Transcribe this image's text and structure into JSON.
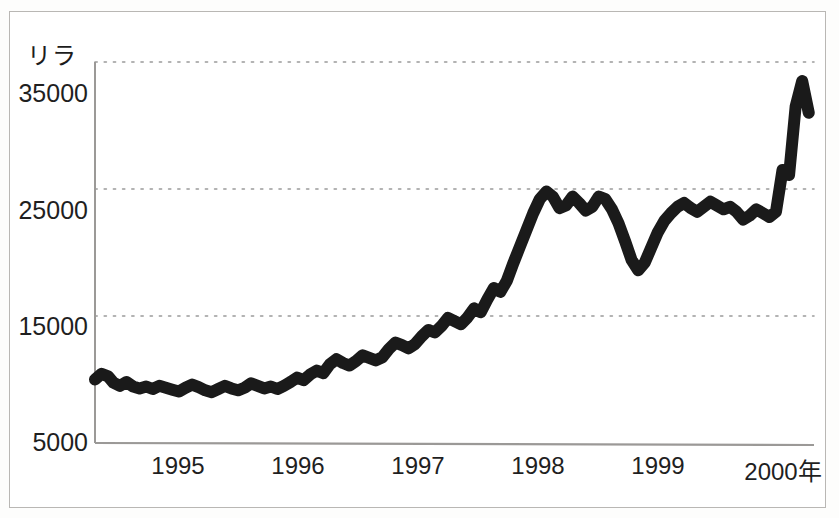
{
  "figure": {
    "background_color": "#ffffff",
    "frame_color": "#b9b7b4",
    "line_color": "#1a1a1a",
    "grid_color": "#9a9a9a",
    "axis_color": "#9b9997"
  },
  "axes": {
    "y_title": "リラ",
    "x_unit_suffix": "年"
  },
  "chart_data": {
    "type": "line",
    "title": "",
    "subtitle": "",
    "xlabel": "年",
    "ylabel": "リラ",
    "grid": true,
    "legend": false,
    "legend_position": "none",
    "xlim": [
      1994.52,
      2000.0
    ],
    "ylim": [
      5000,
      35000
    ],
    "ytick_labels": [
      "5000",
      "15000",
      "25000",
      "35000"
    ],
    "ytick_values": [
      5000,
      15000,
      25000,
      35000
    ],
    "xtick_labels": [
      "1995",
      "1996",
      "1997",
      "1998",
      "1999",
      "2000年"
    ],
    "xtick_values": [
      1995,
      1996,
      1997,
      1998,
      1999,
      2000
    ],
    "series": [
      {
        "name": "USD/TRL",
        "x": [
          1994.52,
          1994.57,
          1994.62,
          1994.66,
          1994.71,
          1994.76,
          1994.81,
          1994.86,
          1994.91,
          1994.96,
          1995.01,
          1995.06,
          1995.11,
          1995.16,
          1995.21,
          1995.26,
          1995.31,
          1995.36,
          1995.41,
          1995.46,
          1995.51,
          1995.56,
          1995.61,
          1995.66,
          1995.71,
          1995.76,
          1995.81,
          1995.86,
          1995.91,
          1995.96,
          1996.01,
          1996.06,
          1996.11,
          1996.16,
          1996.21,
          1996.26,
          1996.31,
          1996.36,
          1996.41,
          1996.46,
          1996.51,
          1996.56,
          1996.61,
          1996.66,
          1996.71,
          1996.76,
          1996.81,
          1996.86,
          1996.91,
          1996.96,
          1997.01,
          1997.06,
          1997.11,
          1997.16,
          1997.21,
          1997.26,
          1997.31,
          1997.36,
          1997.41,
          1997.46,
          1997.51,
          1997.56,
          1997.61,
          1997.66,
          1997.71,
          1997.76,
          1997.81,
          1997.86,
          1997.91,
          1997.96,
          1998.01,
          1998.06,
          1998.11,
          1998.16,
          1998.21,
          1998.26,
          1998.31,
          1998.36,
          1998.41,
          1998.46,
          1998.51,
          1998.56,
          1998.61,
          1998.66,
          1998.71,
          1998.76,
          1998.81,
          1998.86,
          1998.91,
          1998.96,
          1999.01,
          1999.06,
          1999.11,
          1999.16,
          1999.21,
          1999.26,
          1999.31,
          1999.36,
          1999.41,
          1999.46,
          1999.51,
          1999.56,
          1999.61,
          1999.66,
          1999.71,
          1999.76,
          1999.81,
          1999.86,
          1999.91,
          1999.96
        ],
        "y": [
          10000,
          10450,
          10250,
          9750,
          9500,
          9800,
          9450,
          9300,
          9450,
          9250,
          9500,
          9350,
          9200,
          9050,
          9350,
          9600,
          9400,
          9150,
          9000,
          9250,
          9500,
          9300,
          9150,
          9350,
          9700,
          9500,
          9300,
          9450,
          9250,
          9500,
          9800,
          10150,
          9950,
          10400,
          10700,
          10500,
          11200,
          11600,
          11300,
          11100,
          11450,
          11900,
          11700,
          11500,
          11750,
          12400,
          12900,
          12700,
          12450,
          12800,
          13400,
          13900,
          13700,
          14200,
          14850,
          14600,
          14350,
          14900,
          15600,
          15300,
          16300,
          17200,
          16900,
          17800,
          19200,
          20500,
          21800,
          23100,
          24200,
          24800,
          24400,
          23500,
          23700,
          24400,
          23900,
          23300,
          23600,
          24400,
          24200,
          23400,
          22300,
          20900,
          19400,
          18600,
          19200,
          20400,
          21600,
          22500,
          23100,
          23600,
          23900,
          23500,
          23200,
          23600,
          24000,
          23700,
          23400,
          23600,
          23200,
          22600,
          22900,
          23400,
          23100,
          22800,
          23200,
          26500,
          26100,
          31500,
          33500,
          31000
        ]
      }
    ],
    "annotations": []
  }
}
